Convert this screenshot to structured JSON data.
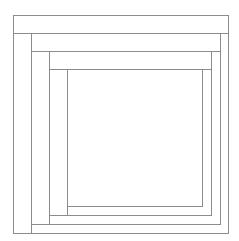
{
  "diagram": {
    "type": "nested-rectangles-log-cabin",
    "line_color": "#8c8c8c",
    "background": "#ffffff",
    "horizontal_lines": [
      {
        "y": 15,
        "x1": 13,
        "x2": 228
      },
      {
        "y": 33,
        "x1": 13,
        "x2": 228
      },
      {
        "y": 51,
        "x1": 31,
        "x2": 220
      },
      {
        "y": 69,
        "x1": 49,
        "x2": 211
      },
      {
        "y": 206,
        "x1": 67,
        "x2": 202
      },
      {
        "y": 215,
        "x1": 49,
        "x2": 211
      },
      {
        "y": 224,
        "x1": 31,
        "x2": 220
      },
      {
        "y": 233,
        "x1": 13,
        "x2": 228
      }
    ],
    "vertical_lines": [
      {
        "x": 13,
        "y1": 15,
        "y2": 233
      },
      {
        "x": 31,
        "y1": 33,
        "y2": 233
      },
      {
        "x": 49,
        "y1": 51,
        "y2": 224
      },
      {
        "x": 67,
        "y1": 69,
        "y2": 215
      },
      {
        "x": 202,
        "y1": 69,
        "y2": 206
      },
      {
        "x": 211,
        "y1": 51,
        "y2": 215
      },
      {
        "x": 220,
        "y1": 33,
        "y2": 224
      },
      {
        "x": 228,
        "y1": 15,
        "y2": 233
      }
    ]
  }
}
